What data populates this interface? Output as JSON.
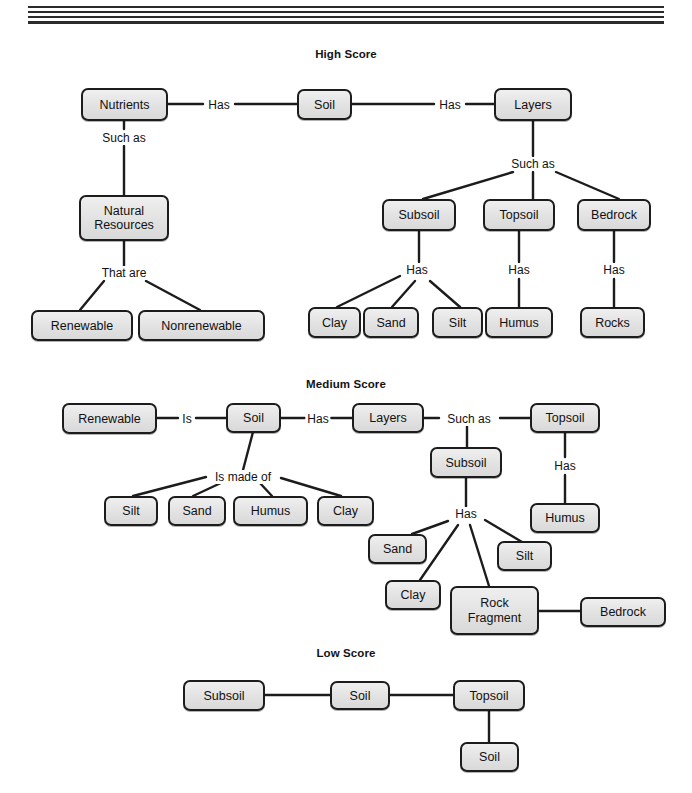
{
  "page": {
    "width": 692,
    "height": 793,
    "background": "#ffffff",
    "ink_color": "#1c1c1c",
    "node_fill": "#e4e4e4"
  },
  "sections": [
    {
      "id": "high",
      "title": "High Score"
    },
    {
      "id": "medium",
      "title": "Medium Score"
    },
    {
      "id": "low",
      "title": "Low Score"
    }
  ],
  "high_score": {
    "title": "High Score",
    "nodes": {
      "nutrients": "Nutrients",
      "soil": "Soil",
      "layers": "Layers",
      "natural_resources": "Natural\nResources",
      "natural_resources_line1": "Natural",
      "natural_resources_line2": "Resources",
      "subsoil": "Subsoil",
      "topsoil": "Topsoil",
      "bedrock": "Bedrock",
      "renewable": "Renewable",
      "nonrenewable": "Nonrenewable",
      "clay": "Clay",
      "sand": "Sand",
      "silt": "Silt",
      "humus": "Humus",
      "rocks": "Rocks"
    },
    "link_labels": {
      "nutrients_soil": "Has",
      "soil_layers": "Has",
      "nutrients_natural_resources": "Such as",
      "natural_resources_children": "That are",
      "layers_children": "Such as",
      "subsoil_children": "Has",
      "topsoil_humus": "Has",
      "bedrock_rocks": "Has"
    }
  },
  "medium_score": {
    "title": "Medium Score",
    "nodes": {
      "renewable": "Renewable",
      "soil": "Soil",
      "layers": "Layers",
      "topsoil": "Topsoil",
      "subsoil": "Subsoil",
      "silt_left": "Silt",
      "sand_left": "Sand",
      "humus_left": "Humus",
      "clay_left": "Clay",
      "humus_right": "Humus",
      "sand_sub": "Sand",
      "silt_sub": "Silt",
      "clay_sub": "Clay",
      "rock_fragment": "Rock\nFragment",
      "rock_fragment_line1": "Rock",
      "rock_fragment_line2": "Fragment",
      "bedrock": "Bedrock"
    },
    "link_labels": {
      "renewable_soil": "Is",
      "soil_layers": "Has",
      "layers_topsoil": "Such as",
      "soil_components": "Is made of",
      "topsoil_humus": "Has",
      "subsoil_children": "Has"
    }
  },
  "low_score": {
    "title": "Low Score",
    "nodes": {
      "subsoil": "Subsoil",
      "soil": "Soil",
      "topsoil": "Topsoil",
      "soil_bottom": "Soil"
    },
    "link_labels": {}
  }
}
